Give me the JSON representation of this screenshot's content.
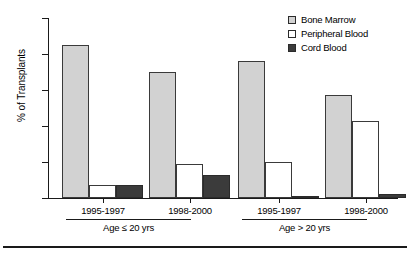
{
  "chart_data": {
    "type": "bar",
    "title": "",
    "xlabel": "",
    "ylabel": "% of Transplants",
    "ylim": [
      0,
      100
    ],
    "yticks": [
      0,
      20,
      40,
      60,
      80,
      100
    ],
    "ytick_labels": [
      "0",
      "20",
      "40",
      "60",
      "80",
      "100"
    ],
    "grid": false,
    "legend_position": "top-right",
    "categories": [
      "1995-1997",
      "1998-2000",
      "1995-1997",
      "1998-2000"
    ],
    "group_labels": [
      "Age ≤ 20 yrs",
      "Age > 20 yrs"
    ],
    "series": [
      {
        "name": "Bone Marrow",
        "color": "#d2d2d2",
        "values": [
          85,
          70,
          76,
          57
        ]
      },
      {
        "name": "Peripheral Blood",
        "color": "#ffffff",
        "values": [
          7,
          19,
          20,
          43
        ]
      },
      {
        "name": "Cord Blood",
        "color": "#3b3b3b",
        "values": [
          7,
          13,
          1,
          2
        ]
      }
    ]
  },
  "legend": {
    "items": [
      {
        "label": "Bone Marrow",
        "swatch": "legend-swatch-bone-marrow"
      },
      {
        "label": "Peripheral Blood",
        "swatch": "legend-swatch-peripheral-blood"
      },
      {
        "label": "Cord Blood",
        "swatch": "legend-swatch-cord-blood"
      }
    ]
  },
  "axes": {
    "y_title": "% of Transplants",
    "y_tick_labels": [
      "100",
      "80",
      "60",
      "40",
      "20",
      "0"
    ],
    "x_period_labels": [
      "1995-1997",
      "1998-2000",
      "1995-1997",
      "1998-2000"
    ],
    "x_group_labels": [
      "Age ≤ 20 yrs",
      "Age > 20 yrs"
    ]
  },
  "colors": {
    "bone_marrow": "#d2d2d2",
    "peripheral_blood": "#ffffff",
    "cord_blood": "#3b3b3b",
    "axis": "#1a1a1a",
    "background": "#ffffff"
  }
}
